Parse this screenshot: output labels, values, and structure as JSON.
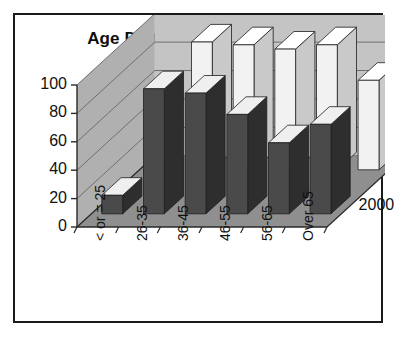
{
  "chart_data": {
    "type": "bar",
    "title": "Age Distribution, 2000-2007",
    "xlabel": "",
    "ylabel": "",
    "ylim": [
      0,
      100
    ],
    "yticks": [
      0,
      20,
      40,
      60,
      80,
      100
    ],
    "grid": true,
    "three_d": true,
    "legend_position": "right-depth-axis",
    "categories": [
      "< or = 25",
      "26-35",
      "36-45",
      "46-55",
      "56-65",
      "Over 65"
    ],
    "series": [
      {
        "name": "2000",
        "color": "#4a4a4a",
        "values": [
          13,
          88,
          85,
          70,
          50,
          63
        ]
      },
      {
        "name": "2007",
        "color": "#f2f2f2",
        "values": [
          0,
          90,
          88,
          85,
          88,
          63
        ]
      }
    ]
  },
  "colors": {
    "wall": "#c4c4c4",
    "wall_side": "#b0b0b0",
    "floor": "#8f8f8f",
    "gridline": "#6f6f6f",
    "axis": "#2a2a2a",
    "border": "#1a1a1a",
    "bar_dark": "#4a4a4a",
    "bar_dark_side": "#2e2e2e",
    "bar_dark_top": "#efefef",
    "bar_light": "#f2f2f2",
    "bar_light_side": "#c9c9c9",
    "bar_light_top": "#ffffff",
    "text": "#111111"
  }
}
